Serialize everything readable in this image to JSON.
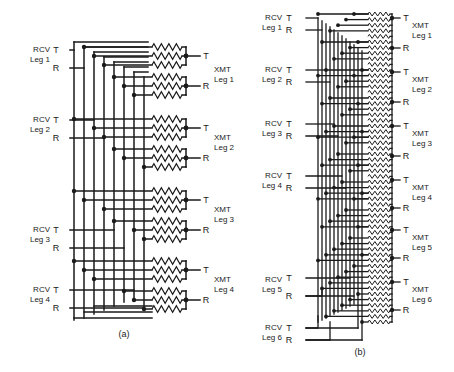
{
  "figure": {
    "type": "schematic-diagram",
    "line_color": "#1a1a1a",
    "background_color": "#ffffff",
    "panels": [
      {
        "id": "a",
        "caption": "(a)",
        "caption_x": 124,
        "caption_y": 337,
        "leg_count": 4,
        "resistor_groups": 8,
        "resistors_per_group": 3,
        "inputs": [
          {
            "name": "RCV",
            "leg": "Leg 1",
            "terminals": [
              "T",
              "R"
            ],
            "label_x": 26,
            "label_y": 52,
            "t_y": 50,
            "r_y": 68
          },
          {
            "name": "RCV",
            "leg": "Leg 2",
            "terminals": [
              "T",
              "R"
            ],
            "label_x": 26,
            "label_y": 122,
            "t_y": 120,
            "r_y": 138
          },
          {
            "name": "RCV",
            "leg": "Leg 3",
            "terminals": [
              "T",
              "R"
            ],
            "label_x": 26,
            "label_y": 232,
            "t_y": 230,
            "r_y": 248
          },
          {
            "name": "RCV",
            "leg": "Leg 4",
            "terminals": [
              "T",
              "R"
            ],
            "label_x": 26,
            "label_y": 292,
            "t_y": 290,
            "r_y": 308
          }
        ],
        "outputs": [
          {
            "name": "XMT",
            "leg": "Leg 1",
            "terminals": [
              "T",
              "R"
            ],
            "label_x": 214,
            "label_y": 72,
            "t_y": 56,
            "r_y": 86
          },
          {
            "name": "XMT",
            "leg": "Leg 2",
            "terminals": [
              "T",
              "R"
            ],
            "label_x": 214,
            "label_y": 140,
            "t_y": 128,
            "r_y": 158
          },
          {
            "name": "XMT",
            "leg": "Leg 3",
            "terminals": [
              "T",
              "R"
            ],
            "label_x": 214,
            "label_y": 212,
            "t_y": 200,
            "r_y": 230
          },
          {
            "name": "XMT",
            "leg": "Leg 4",
            "terminals": [
              "T",
              "R"
            ],
            "label_x": 214,
            "label_y": 282,
            "t_y": 270,
            "r_y": 300
          }
        ]
      },
      {
        "id": "b",
        "caption": "(b)",
        "caption_x": 360,
        "caption_y": 355,
        "leg_count": 6,
        "resistor_rows": 56,
        "inputs": [
          {
            "name": "RCV",
            "leg": "Leg 1",
            "terminals": [
              "T",
              "R"
            ],
            "label_x": 262,
            "label_y": 20,
            "t_y": 18,
            "r_y": 30
          },
          {
            "name": "RCV",
            "leg": "Leg 2",
            "terminals": [
              "T",
              "R"
            ],
            "label_x": 262,
            "label_y": 72,
            "t_y": 70,
            "r_y": 82
          },
          {
            "name": "RCV",
            "leg": "Leg 3",
            "terminals": [
              "T",
              "R"
            ],
            "label_x": 262,
            "label_y": 126,
            "t_y": 124,
            "r_y": 136
          },
          {
            "name": "RCV",
            "leg": "Leg 4",
            "terminals": [
              "T",
              "R"
            ],
            "label_x": 262,
            "label_y": 178,
            "t_y": 176,
            "r_y": 188
          },
          {
            "name": "RCV",
            "leg": "Leg 5",
            "terminals": [
              "T",
              "R"
            ],
            "label_x": 262,
            "label_y": 282,
            "t_y": 278,
            "r_y": 296
          },
          {
            "name": "RCV",
            "leg": "Leg 6",
            "terminals": [
              "T",
              "R"
            ],
            "label_x": 262,
            "label_y": 330,
            "t_y": 328,
            "r_y": 340
          }
        ],
        "outputs": [
          {
            "name": "XMT",
            "leg": "Leg 1",
            "terminals": [
              "T",
              "R"
            ],
            "label_x": 412,
            "label_y": 28,
            "t_y": 18,
            "r_y": 48
          },
          {
            "name": "XMT",
            "leg": "Leg 2",
            "terminals": [
              "T",
              "R"
            ],
            "label_x": 412,
            "label_y": 82,
            "t_y": 72,
            "r_y": 102
          },
          {
            "name": "XMT",
            "leg": "Leg 3",
            "terminals": [
              "T",
              "R"
            ],
            "label_x": 412,
            "label_y": 136,
            "t_y": 126,
            "r_y": 156
          },
          {
            "name": "XMT",
            "leg": "Leg 4",
            "terminals": [
              "T",
              "R"
            ],
            "label_x": 412,
            "label_y": 190,
            "t_y": 180,
            "r_y": 208
          },
          {
            "name": "XMT",
            "leg": "Leg 5",
            "terminals": [
              "T",
              "R"
            ],
            "label_x": 412,
            "label_y": 240,
            "t_y": 230,
            "r_y": 258
          },
          {
            "name": "XMT",
            "leg": "Leg 6",
            "terminals": [
              "T",
              "R"
            ],
            "label_x": 412,
            "label_y": 292,
            "t_y": 282,
            "r_y": 310
          }
        ]
      }
    ]
  }
}
